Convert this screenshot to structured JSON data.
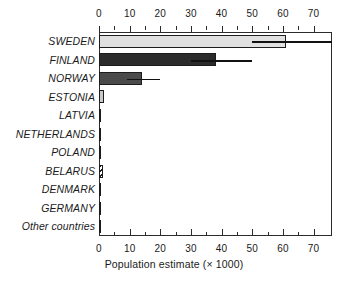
{
  "chart_data": {
    "type": "bar",
    "orientation": "horizontal",
    "title": "",
    "xlabel": "Population estimate (× 1000)",
    "ylabel": "",
    "xlim": [
      0,
      76
    ],
    "grid": false,
    "legend": "none",
    "axis_positions": [
      "top",
      "bottom"
    ],
    "xticks": [
      0,
      10,
      20,
      30,
      40,
      50,
      60,
      70
    ],
    "xtick_labels": [
      "0",
      "10",
      "20",
      "30",
      "40",
      "50",
      "60",
      "70"
    ],
    "xminor_ticks": [
      5,
      15,
      25,
      35,
      45,
      55,
      65
    ],
    "categories": [
      "SWEDEN",
      "FINLAND",
      "NORWAY",
      "ESTONIA",
      "LATVIA",
      "NETHERLANDS",
      "POLAND",
      "BELARUS",
      "DENMARK",
      "GERMANY",
      "Other countries"
    ],
    "values": [
      61,
      38,
      14,
      1.5,
      0.3,
      0.6,
      0.3,
      1.4,
      0.4,
      0.6,
      0.2
    ],
    "error_low": [
      50,
      30,
      9,
      null,
      null,
      null,
      null,
      null,
      null,
      null,
      null
    ],
    "error_high": [
      76,
      50,
      20,
      null,
      null,
      null,
      null,
      null,
      null,
      null,
      null
    ],
    "bar_fills": [
      "#e0e0e0",
      "#2b2b2b",
      "#4a4a4a",
      "#c8c8c8",
      "#3a3a3a",
      "#141414",
      "#3a3a3a",
      "hatch",
      "#4a4a4a",
      "#545454",
      "#3a3a3a"
    ]
  },
  "colors": {
    "axis": "#2b2b2b",
    "text": "#1a1a1a",
    "error": "#111111",
    "background": "#ffffff",
    "bar_outline": "#1c1c1c"
  }
}
